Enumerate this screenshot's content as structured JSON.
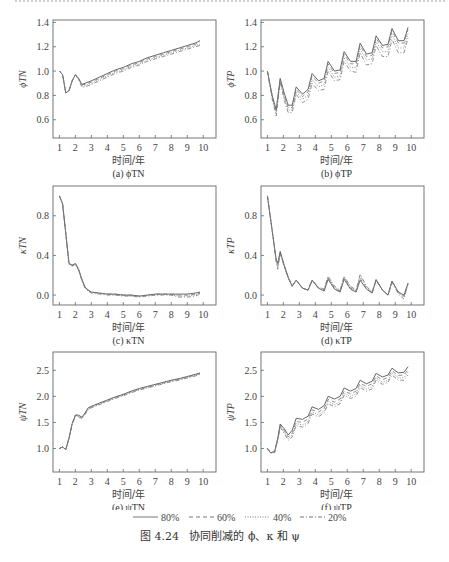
{
  "figure": {
    "caption": "图 4.24   协同削减的 ϕ、κ 和 ψ",
    "legend": [
      {
        "label": "80%",
        "style": "solid"
      },
      {
        "label": "60%",
        "style": "dashed"
      },
      {
        "label": "40%",
        "style": "dotted"
      },
      {
        "label": "20%",
        "style": "dashdot"
      }
    ],
    "xlabel": "时间/年"
  },
  "chart_data": [
    {
      "id": "a",
      "type": "line",
      "caption": "(a) ϕTN",
      "ylabel": "ϕTN",
      "xlabel": "时间/年",
      "xlim": [
        0.6,
        10.8
      ],
      "ylim": [
        0.45,
        1.42
      ],
      "xticks": [
        1,
        2,
        3,
        4,
        5,
        6,
        7,
        8,
        9,
        10
      ],
      "yticks": [
        0.6,
        0.8,
        1.0,
        1.2,
        1.4
      ],
      "x": [
        1,
        1.2,
        1.4,
        1.6,
        1.8,
        2.0,
        2.2,
        2.4,
        2.6,
        3,
        3.5,
        4,
        4.5,
        5,
        5.5,
        6,
        6.5,
        7,
        7.5,
        8,
        8.5,
        9,
        9.5,
        9.8
      ],
      "series": [
        {
          "name": "80%",
          "values": [
            1.0,
            0.97,
            0.82,
            0.84,
            0.92,
            0.97,
            0.94,
            0.89,
            0.9,
            0.92,
            0.95,
            0.98,
            1.01,
            1.03,
            1.06,
            1.08,
            1.11,
            1.13,
            1.15,
            1.17,
            1.19,
            1.21,
            1.23,
            1.25
          ]
        },
        {
          "name": "60%",
          "values": [
            1.0,
            0.97,
            0.82,
            0.84,
            0.92,
            0.97,
            0.94,
            0.89,
            0.89,
            0.91,
            0.94,
            0.97,
            1.0,
            1.02,
            1.05,
            1.07,
            1.1,
            1.12,
            1.14,
            1.16,
            1.18,
            1.2,
            1.22,
            1.24
          ]
        },
        {
          "name": "40%",
          "values": [
            1.0,
            0.97,
            0.82,
            0.84,
            0.92,
            0.97,
            0.94,
            0.88,
            0.88,
            0.9,
            0.93,
            0.96,
            0.99,
            1.01,
            1.04,
            1.06,
            1.09,
            1.11,
            1.13,
            1.15,
            1.17,
            1.19,
            1.21,
            1.22
          ]
        },
        {
          "name": "20%",
          "values": [
            1.0,
            0.97,
            0.82,
            0.84,
            0.92,
            0.97,
            0.93,
            0.87,
            0.87,
            0.89,
            0.92,
            0.95,
            0.98,
            1.0,
            1.03,
            1.05,
            1.08,
            1.1,
            1.12,
            1.14,
            1.16,
            1.18,
            1.2,
            1.21
          ]
        }
      ]
    },
    {
      "id": "b",
      "type": "line",
      "caption": "(b) ϕTP",
      "ylabel": "ϕTP",
      "xlabel": "时间/年",
      "xlim": [
        0.6,
        10.8
      ],
      "ylim": [
        0.45,
        1.42
      ],
      "xticks": [
        1,
        2,
        3,
        4,
        5,
        6,
        7,
        8,
        9,
        10
      ],
      "yticks": [
        0.6,
        0.8,
        1.0,
        1.2,
        1.4
      ],
      "x": [
        1,
        1.3,
        1.55,
        1.8,
        2.05,
        2.3,
        2.55,
        2.8,
        3.2,
        3.55,
        3.8,
        4.2,
        4.55,
        4.8,
        5.2,
        5.55,
        5.8,
        6.2,
        6.55,
        6.8,
        7.2,
        7.55,
        7.8,
        8.2,
        8.55,
        8.8,
        9.2,
        9.55,
        9.8
      ],
      "series": [
        {
          "name": "80%",
          "values": [
            1.0,
            0.8,
            0.68,
            0.94,
            0.82,
            0.72,
            0.72,
            0.87,
            0.81,
            0.85,
            0.98,
            0.92,
            0.94,
            1.08,
            1.0,
            1.01,
            1.16,
            1.08,
            1.08,
            1.23,
            1.14,
            1.15,
            1.29,
            1.21,
            1.22,
            1.35,
            1.25,
            1.25,
            1.36
          ]
        },
        {
          "name": "60%",
          "values": [
            1.0,
            0.79,
            0.67,
            0.93,
            0.8,
            0.7,
            0.7,
            0.85,
            0.79,
            0.83,
            0.96,
            0.9,
            0.92,
            1.06,
            0.98,
            0.99,
            1.14,
            1.06,
            1.06,
            1.21,
            1.12,
            1.13,
            1.27,
            1.19,
            1.2,
            1.33,
            1.23,
            1.23,
            1.34
          ]
        },
        {
          "name": "40%",
          "values": [
            1.0,
            0.78,
            0.65,
            0.92,
            0.78,
            0.68,
            0.68,
            0.83,
            0.77,
            0.8,
            0.93,
            0.87,
            0.89,
            1.03,
            0.95,
            0.96,
            1.11,
            1.03,
            1.03,
            1.18,
            1.09,
            1.1,
            1.24,
            1.16,
            1.16,
            1.3,
            1.19,
            1.19,
            1.31
          ]
        },
        {
          "name": "20%",
          "values": [
            1.0,
            0.77,
            0.63,
            0.91,
            0.76,
            0.66,
            0.66,
            0.81,
            0.74,
            0.77,
            0.9,
            0.84,
            0.85,
            1.0,
            0.92,
            0.93,
            1.08,
            1.0,
            0.99,
            1.15,
            1.05,
            1.06,
            1.21,
            1.12,
            1.12,
            1.26,
            1.15,
            1.15,
            1.27
          ]
        }
      ]
    },
    {
      "id": "c",
      "type": "line",
      "caption": "(c) κTN",
      "ylabel": "κTN",
      "xlabel": "时间/年",
      "xlim": [
        0.6,
        10.8
      ],
      "ylim": [
        -0.1,
        1.1
      ],
      "xticks": [
        1,
        2,
        3,
        4,
        5,
        6,
        7,
        8,
        9,
        10
      ],
      "yticks": [
        0.0,
        0.4,
        0.8
      ],
      "x": [
        1,
        1.2,
        1.4,
        1.6,
        1.8,
        2.0,
        2.2,
        2.4,
        2.6,
        2.8,
        3,
        3.5,
        4,
        4.5,
        5,
        5.5,
        6,
        6.5,
        7,
        7.5,
        8,
        8.5,
        9,
        9.5,
        9.8
      ],
      "series": [
        {
          "name": "80%",
          "values": [
            1.0,
            0.92,
            0.62,
            0.32,
            0.3,
            0.32,
            0.26,
            0.16,
            0.08,
            0.05,
            0.03,
            0.02,
            0.01,
            0.01,
            0.0,
            0.0,
            -0.01,
            0.0,
            0.01,
            0.01,
            0.01,
            0.01,
            0.01,
            0.02,
            0.03
          ]
        },
        {
          "name": "60%",
          "values": [
            1.0,
            0.92,
            0.62,
            0.32,
            0.3,
            0.32,
            0.26,
            0.16,
            0.08,
            0.05,
            0.03,
            0.02,
            0.01,
            0.01,
            0.0,
            0.0,
            -0.01,
            0.0,
            0.01,
            0.01,
            0.01,
            0.0,
            0.0,
            0.01,
            0.02
          ]
        },
        {
          "name": "40%",
          "values": [
            1.0,
            0.92,
            0.62,
            0.31,
            0.3,
            0.31,
            0.25,
            0.15,
            0.07,
            0.04,
            0.03,
            0.02,
            0.01,
            0.0,
            0.0,
            -0.01,
            -0.01,
            0.0,
            0.0,
            0.01,
            0.0,
            -0.01,
            -0.01,
            0.0,
            0.02
          ]
        },
        {
          "name": "20%",
          "values": [
            1.0,
            0.92,
            0.61,
            0.31,
            0.29,
            0.31,
            0.25,
            0.15,
            0.07,
            0.04,
            0.02,
            0.01,
            0.0,
            0.0,
            -0.01,
            -0.01,
            -0.02,
            -0.01,
            0.0,
            0.0,
            0.0,
            -0.02,
            -0.02,
            -0.01,
            0.01
          ]
        }
      ]
    },
    {
      "id": "d",
      "type": "line",
      "caption": "(d) κTP",
      "ylabel": "κTP",
      "xlabel": "时间/年",
      "xlim": [
        0.6,
        10.8
      ],
      "ylim": [
        -0.1,
        1.1
      ],
      "xticks": [
        1,
        2,
        3,
        4,
        5,
        6,
        7,
        8,
        9,
        10
      ],
      "yticks": [
        0.0,
        0.4,
        0.8
      ],
      "x": [
        1,
        1.3,
        1.55,
        1.65,
        1.8,
        2.05,
        2.3,
        2.55,
        2.8,
        3.2,
        3.55,
        3.8,
        4.2,
        4.55,
        4.8,
        5.2,
        5.55,
        5.8,
        6.2,
        6.55,
        6.8,
        7.2,
        7.55,
        7.8,
        8.2,
        8.55,
        8.8,
        9.2,
        9.55,
        9.8
      ],
      "series": [
        {
          "name": "80%",
          "values": [
            1.0,
            0.65,
            0.36,
            0.32,
            0.44,
            0.3,
            0.18,
            0.09,
            0.15,
            0.07,
            0.05,
            0.15,
            0.07,
            0.04,
            0.16,
            0.06,
            0.03,
            0.16,
            0.06,
            0.03,
            0.15,
            0.06,
            0.02,
            0.15,
            0.05,
            0.0,
            0.14,
            0.03,
            0.0,
            0.12
          ]
        },
        {
          "name": "60%",
          "values": [
            1.0,
            0.65,
            0.35,
            0.3,
            0.43,
            0.3,
            0.18,
            0.09,
            0.15,
            0.07,
            0.05,
            0.15,
            0.07,
            0.05,
            0.17,
            0.07,
            0.04,
            0.17,
            0.07,
            0.04,
            0.17,
            0.07,
            0.02,
            0.15,
            0.05,
            0.0,
            0.14,
            0.03,
            -0.01,
            0.12
          ]
        },
        {
          "name": "40%",
          "values": [
            1.0,
            0.65,
            0.34,
            0.28,
            0.43,
            0.29,
            0.17,
            0.09,
            0.15,
            0.07,
            0.05,
            0.15,
            0.07,
            0.05,
            0.18,
            0.08,
            0.04,
            0.18,
            0.08,
            0.04,
            0.2,
            0.08,
            0.03,
            0.16,
            0.05,
            0.0,
            0.14,
            0.02,
            -0.02,
            0.12
          ]
        },
        {
          "name": "20%",
          "values": [
            1.0,
            0.65,
            0.33,
            0.26,
            0.42,
            0.29,
            0.17,
            0.09,
            0.15,
            0.07,
            0.05,
            0.15,
            0.08,
            0.06,
            0.19,
            0.09,
            0.05,
            0.19,
            0.09,
            0.05,
            0.21,
            0.09,
            0.03,
            0.16,
            0.05,
            0.0,
            0.13,
            0.01,
            -0.04,
            0.11
          ]
        }
      ]
    },
    {
      "id": "e",
      "type": "line",
      "caption": "(e) ψTN",
      "ylabel": "ψTN",
      "xlabel": "时间/年",
      "xlim": [
        0.6,
        10.8
      ],
      "ylim": [
        0.55,
        2.85
      ],
      "xticks": [
        1,
        2,
        3,
        4,
        5,
        6,
        7,
        8,
        9,
        10
      ],
      "yticks": [
        1.0,
        1.5,
        2.0,
        2.5
      ],
      "x": [
        1,
        1.2,
        1.4,
        1.6,
        1.8,
        2.0,
        2.2,
        2.4,
        2.6,
        2.8,
        3,
        3.5,
        4,
        4.5,
        5,
        5.5,
        6,
        6.5,
        7,
        7.5,
        8,
        8.5,
        9,
        9.5,
        9.8
      ],
      "series": [
        {
          "name": "80%",
          "values": [
            1.0,
            1.03,
            0.98,
            1.2,
            1.48,
            1.64,
            1.64,
            1.6,
            1.68,
            1.78,
            1.81,
            1.87,
            1.93,
            1.99,
            2.04,
            2.1,
            2.15,
            2.19,
            2.23,
            2.27,
            2.31,
            2.34,
            2.38,
            2.42,
            2.45
          ]
        },
        {
          "name": "60%",
          "values": [
            1.0,
            1.03,
            0.98,
            1.2,
            1.48,
            1.64,
            1.63,
            1.59,
            1.67,
            1.77,
            1.8,
            1.86,
            1.92,
            1.98,
            2.03,
            2.09,
            2.14,
            2.18,
            2.22,
            2.26,
            2.3,
            2.33,
            2.37,
            2.41,
            2.44
          ]
        },
        {
          "name": "40%",
          "values": [
            1.0,
            1.03,
            0.98,
            1.19,
            1.47,
            1.63,
            1.62,
            1.58,
            1.66,
            1.76,
            1.79,
            1.85,
            1.91,
            1.97,
            2.02,
            2.08,
            2.13,
            2.17,
            2.21,
            2.25,
            2.29,
            2.32,
            2.36,
            2.4,
            2.43
          ]
        },
        {
          "name": "20%",
          "values": [
            1.0,
            1.03,
            0.98,
            1.19,
            1.46,
            1.62,
            1.61,
            1.57,
            1.65,
            1.75,
            1.78,
            1.84,
            1.9,
            1.96,
            2.01,
            2.07,
            2.12,
            2.16,
            2.2,
            2.24,
            2.28,
            2.31,
            2.35,
            2.39,
            2.42
          ]
        }
      ]
    },
    {
      "id": "f",
      "type": "line",
      "caption": "(f) ψTP",
      "ylabel": "ψTP",
      "xlabel": "时间/年",
      "xlim": [
        0.6,
        10.8
      ],
      "ylim": [
        0.55,
        2.85
      ],
      "xticks": [
        1,
        2,
        3,
        4,
        5,
        6,
        7,
        8,
        9,
        10
      ],
      "yticks": [
        1.0,
        1.5,
        2.0,
        2.5
      ],
      "x": [
        1,
        1.2,
        1.45,
        1.65,
        1.8,
        2.05,
        2.3,
        2.55,
        2.8,
        3.2,
        3.55,
        3.8,
        4.2,
        4.55,
        4.8,
        5.2,
        5.55,
        5.8,
        6.2,
        6.55,
        6.8,
        7.2,
        7.55,
        7.8,
        8.2,
        8.55,
        8.8,
        9.2,
        9.55,
        9.8
      ],
      "series": [
        {
          "name": "80%",
          "values": [
            1.0,
            0.92,
            0.94,
            1.2,
            1.47,
            1.38,
            1.26,
            1.35,
            1.58,
            1.56,
            1.62,
            1.8,
            1.75,
            1.82,
            2.0,
            1.95,
            2.0,
            2.16,
            2.1,
            2.15,
            2.31,
            2.24,
            2.29,
            2.44,
            2.37,
            2.41,
            2.54,
            2.45,
            2.46,
            2.57
          ]
        },
        {
          "name": "60%",
          "values": [
            1.0,
            0.92,
            0.94,
            1.19,
            1.45,
            1.35,
            1.22,
            1.3,
            1.52,
            1.5,
            1.57,
            1.74,
            1.7,
            1.77,
            1.94,
            1.89,
            1.95,
            2.1,
            2.05,
            2.1,
            2.25,
            2.19,
            2.24,
            2.39,
            2.32,
            2.36,
            2.49,
            2.4,
            2.41,
            2.51
          ]
        },
        {
          "name": "40%",
          "values": [
            1.0,
            0.92,
            0.93,
            1.18,
            1.43,
            1.32,
            1.19,
            1.26,
            1.48,
            1.45,
            1.52,
            1.7,
            1.65,
            1.72,
            1.9,
            1.84,
            1.9,
            2.06,
            2.0,
            2.05,
            2.21,
            2.14,
            2.19,
            2.35,
            2.27,
            2.31,
            2.45,
            2.35,
            2.36,
            2.46
          ]
        },
        {
          "name": "20%",
          "values": [
            1.0,
            0.91,
            0.92,
            1.16,
            1.41,
            1.29,
            1.16,
            1.22,
            1.44,
            1.41,
            1.48,
            1.66,
            1.61,
            1.68,
            1.86,
            1.8,
            1.86,
            2.02,
            1.96,
            2.0,
            2.17,
            2.1,
            2.14,
            2.31,
            2.23,
            2.27,
            2.41,
            2.31,
            2.31,
            2.41
          ]
        }
      ]
    }
  ]
}
